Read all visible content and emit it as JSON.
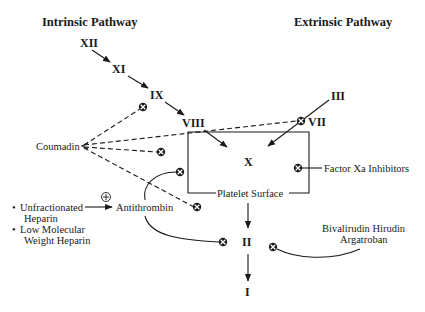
{
  "diagram": {
    "titles": {
      "intrinsic": "Intrinsic Pathway",
      "extrinsic": "Extrinsic Pathway"
    },
    "factors": {
      "xii": "XII",
      "xi": "XI",
      "ix": "IX",
      "viii": "VIII",
      "iii": "III",
      "vii": "VII",
      "x": "X",
      "ii": "II",
      "i": "I"
    },
    "box_label": "Platelet Surface",
    "drugs": {
      "coumadin": "Coumadin",
      "antithrombin": "Antithrombin",
      "heparin_items": [
        "Unfractionated",
        "Heparin",
        "Low Molecular",
        "Weight Heparin"
      ],
      "bullet": "•",
      "factor_xa_inhibitors": "Factor Xa Inhibitors",
      "direct_thrombin_line1": "Bivalirudin Hirudin",
      "direct_thrombin_line2": "Argatroban"
    },
    "symbols": {
      "inhibit": "inhibition-symbol (circled x)",
      "activate": "activation-symbol (circled plus)"
    },
    "colors": {
      "ink": "#1a1a1a",
      "background": "#ffffff"
    }
  }
}
